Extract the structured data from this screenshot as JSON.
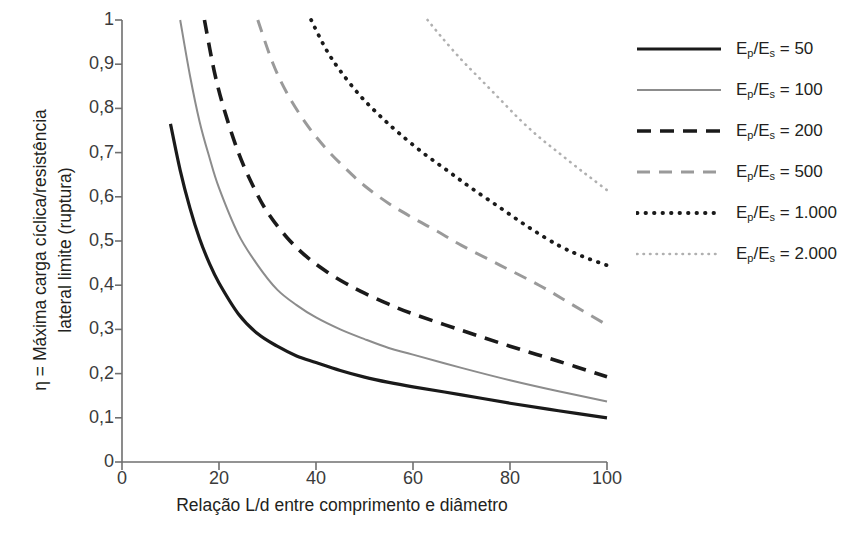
{
  "chart_data": {
    "type": "line",
    "title": "",
    "xlabel": "Relação L/d entre comprimento e diâmetro",
    "ylabel": "η = Máxima carga cíclica/resistência\nlateral limite (ruptura)",
    "xlim": [
      0,
      100
    ],
    "ylim": [
      0,
      1
    ],
    "grid": false,
    "legend_position": "right",
    "xticks": [
      "0",
      "20",
      "40",
      "60",
      "80",
      "100"
    ],
    "xtick_values": [
      0,
      20,
      40,
      60,
      80,
      100
    ],
    "yticks": [
      "0",
      "0,1",
      "0,2",
      "0,3",
      "0,4",
      "0,5",
      "0,6",
      "0,7",
      "0,8",
      "0,9",
      "1"
    ],
    "ytick_values": [
      0,
      0.1,
      0.2,
      0.3,
      0.4,
      0.5,
      0.6,
      0.7,
      0.8,
      0.9,
      1
    ],
    "series": [
      {
        "name": "Ep/Es = 50",
        "label_base": "E",
        "sub1": "p",
        "sub2": "s",
        "ratio": "50",
        "style": "solid",
        "color": "#1a1a1a",
        "width": 3.2,
        "dash": "none",
        "points": [
          [
            10,
            0.765
          ],
          [
            12,
            0.66
          ],
          [
            14,
            0.575
          ],
          [
            16,
            0.505
          ],
          [
            18,
            0.45
          ],
          [
            20,
            0.405
          ],
          [
            24,
            0.335
          ],
          [
            28,
            0.29
          ],
          [
            32,
            0.262
          ],
          [
            36,
            0.24
          ],
          [
            40,
            0.225
          ],
          [
            45,
            0.207
          ],
          [
            50,
            0.192
          ],
          [
            55,
            0.18
          ],
          [
            60,
            0.17
          ],
          [
            70,
            0.152
          ],
          [
            80,
            0.133
          ],
          [
            90,
            0.116
          ],
          [
            100,
            0.1
          ]
        ]
      },
      {
        "name": "Ep/Es = 100",
        "label_base": "E",
        "sub1": "p",
        "sub2": "s",
        "ratio": "100",
        "style": "solid",
        "color": "#8c8c8c",
        "width": 2.0,
        "dash": "none",
        "points": [
          [
            12,
            1.0
          ],
          [
            14,
            0.875
          ],
          [
            16,
            0.77
          ],
          [
            18,
            0.69
          ],
          [
            20,
            0.62
          ],
          [
            24,
            0.515
          ],
          [
            28,
            0.445
          ],
          [
            32,
            0.39
          ],
          [
            36,
            0.355
          ],
          [
            40,
            0.327
          ],
          [
            45,
            0.3
          ],
          [
            50,
            0.278
          ],
          [
            55,
            0.258
          ],
          [
            60,
            0.243
          ],
          [
            70,
            0.213
          ],
          [
            80,
            0.185
          ],
          [
            90,
            0.16
          ],
          [
            100,
            0.137
          ]
        ]
      },
      {
        "name": "Ep/Es = 200",
        "label_base": "E",
        "sub1": "p",
        "sub2": "s",
        "ratio": "200",
        "style": "dashed",
        "color": "#1a1a1a",
        "width": 3.6,
        "dash": "14,9",
        "points": [
          [
            17,
            1.0
          ],
          [
            19,
            0.885
          ],
          [
            21,
            0.8
          ],
          [
            24,
            0.7
          ],
          [
            27,
            0.625
          ],
          [
            30,
            0.565
          ],
          [
            34,
            0.508
          ],
          [
            38,
            0.465
          ],
          [
            42,
            0.432
          ],
          [
            46,
            0.405
          ],
          [
            50,
            0.382
          ],
          [
            55,
            0.357
          ],
          [
            60,
            0.335
          ],
          [
            70,
            0.298
          ],
          [
            80,
            0.262
          ],
          [
            90,
            0.228
          ],
          [
            100,
            0.193
          ]
        ]
      },
      {
        "name": "Ep/Es = 500",
        "label_base": "E",
        "sub1": "p",
        "sub2": "s",
        "ratio": "500",
        "style": "dashed",
        "color": "#9a9a9a",
        "width": 3.0,
        "dash": "13,9",
        "points": [
          [
            28,
            1.0
          ],
          [
            31,
            0.905
          ],
          [
            34,
            0.835
          ],
          [
            38,
            0.765
          ],
          [
            42,
            0.71
          ],
          [
            46,
            0.665
          ],
          [
            50,
            0.625
          ],
          [
            55,
            0.585
          ],
          [
            60,
            0.552
          ],
          [
            65,
            0.522
          ],
          [
            70,
            0.49
          ],
          [
            78,
            0.445
          ],
          [
            86,
            0.4
          ],
          [
            93,
            0.355
          ],
          [
            100,
            0.31
          ]
        ]
      },
      {
        "name": "Ep/Es = 1.000",
        "label_base": "E",
        "sub1": "p",
        "sub2": "s",
        "ratio": "1.000",
        "style": "dotted",
        "color": "#1a1a1a",
        "width": 3.8,
        "dash": "0.5,8",
        "points": [
          [
            39,
            1.0
          ],
          [
            42,
            0.935
          ],
          [
            45,
            0.885
          ],
          [
            49,
            0.83
          ],
          [
            53,
            0.785
          ],
          [
            57,
            0.745
          ],
          [
            62,
            0.7
          ],
          [
            67,
            0.66
          ],
          [
            72,
            0.62
          ],
          [
            78,
            0.575
          ],
          [
            84,
            0.53
          ],
          [
            90,
            0.49
          ],
          [
            95,
            0.465
          ],
          [
            100,
            0.445
          ]
        ]
      },
      {
        "name": "Ep/Es = 2.000",
        "label_base": "E",
        "sub1": "p",
        "sub2": "s",
        "ratio": "2.000",
        "style": "dotted",
        "color": "#b0b0b0",
        "width": 2.6,
        "dash": "0.5,6",
        "points": [
          [
            63,
            1.0
          ],
          [
            66,
            0.96
          ],
          [
            70,
            0.91
          ],
          [
            74,
            0.865
          ],
          [
            78,
            0.82
          ],
          [
            82,
            0.775
          ],
          [
            86,
            0.735
          ],
          [
            90,
            0.7
          ],
          [
            94,
            0.665
          ],
          [
            97,
            0.64
          ],
          [
            100,
            0.615
          ]
        ]
      }
    ]
  },
  "axis": {
    "color": "#6f6f6f"
  },
  "legend": {
    "items": [
      {
        "label": "Ep/Es = 50"
      },
      {
        "label": "Ep/Es = 100"
      },
      {
        "label": "Ep/Es = 200"
      },
      {
        "label": "Ep/Es = 500"
      },
      {
        "label": "Ep/Es = 1.000"
      },
      {
        "label": "Ep/Es = 2.000"
      }
    ]
  }
}
